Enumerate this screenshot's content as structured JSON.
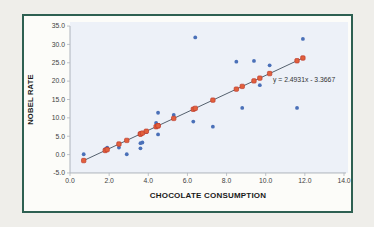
{
  "window": {
    "background_color": "#efeeea"
  },
  "chart": {
    "border_color": "#2e6052",
    "card_background": "#fcfcf9",
    "plot_background": "#edf1f8",
    "axis_line_color": "#aeb4bc",
    "tick_label_color": "#3f3f3f"
  },
  "chart_data": {
    "type": "scatter",
    "title": "",
    "xlabel": "CHOCOLATE CONSUMPTION",
    "ylabel": "NOBEL RATE",
    "xlim": [
      0,
      14
    ],
    "ylim": [
      -5,
      35
    ],
    "grid": false,
    "legend": "none",
    "x_tick_labels": [
      "0.0",
      "2.0",
      "4.0",
      "6.0",
      "8.0",
      "10.0",
      "12.0",
      "14.0"
    ],
    "y_tick_labels": [
      "-5.0",
      "0.0",
      "5.0",
      "10.0",
      "15.0",
      "20.0",
      "25.0",
      "30.0",
      "35.0"
    ],
    "series": [
      {
        "name": "actual",
        "marker": "circle",
        "color": "#4a70b8",
        "points": [
          [
            0.7,
            0.1
          ],
          [
            1.8,
            1.5
          ],
          [
            1.9,
            1.9
          ],
          [
            2.5,
            1.9
          ],
          [
            2.9,
            0.1
          ],
          [
            3.6,
            3.1
          ],
          [
            3.6,
            1.7
          ],
          [
            3.7,
            3.3
          ],
          [
            3.9,
            6.1
          ],
          [
            4.4,
            8.6
          ],
          [
            4.5,
            5.5
          ],
          [
            4.5,
            11.4
          ],
          [
            5.3,
            10.8
          ],
          [
            6.3,
            9.0
          ],
          [
            6.4,
            31.9
          ],
          [
            7.3,
            7.6
          ],
          [
            8.5,
            25.3
          ],
          [
            8.8,
            12.7
          ],
          [
            9.4,
            25.5
          ],
          [
            9.7,
            18.9
          ],
          [
            10.2,
            24.3
          ],
          [
            11.6,
            12.7
          ],
          [
            11.9,
            31.5
          ]
        ]
      },
      {
        "name": "predicted",
        "marker": "square",
        "color": "#e2603c",
        "edge_color": "#bd3b2c",
        "points": [
          [
            0.7,
            -1.62
          ],
          [
            1.8,
            1.12
          ],
          [
            1.9,
            1.37
          ],
          [
            2.5,
            2.87
          ],
          [
            2.9,
            3.86
          ],
          [
            3.6,
            5.61
          ],
          [
            3.6,
            5.61
          ],
          [
            3.7,
            5.86
          ],
          [
            3.9,
            6.36
          ],
          [
            4.4,
            7.6
          ],
          [
            4.5,
            7.85
          ],
          [
            4.5,
            7.85
          ],
          [
            5.3,
            9.85
          ],
          [
            6.3,
            12.34
          ],
          [
            6.4,
            12.59
          ],
          [
            7.3,
            14.83
          ],
          [
            8.5,
            17.82
          ],
          [
            8.8,
            18.57
          ],
          [
            9.4,
            20.07
          ],
          [
            9.7,
            20.82
          ],
          [
            10.2,
            22.06
          ],
          [
            11.6,
            25.55
          ],
          [
            11.9,
            26.3
          ]
        ]
      }
    ],
    "trendline": {
      "slope": 2.4931,
      "intercept": -3.3667,
      "x_start": 0.7,
      "x_end": 11.9,
      "color": "#55616e",
      "equation": "y = 2.4931x - 3.3667"
    }
  }
}
